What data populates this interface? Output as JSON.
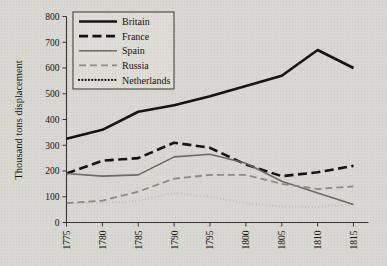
{
  "figure": {
    "background_color": "#d9d7d1",
    "ink_color": "#14110f"
  },
  "axis_titles": {
    "y": "Thousand tons displacement",
    "x": ""
  },
  "legend": {
    "position": "top-left-inside",
    "entries": [
      {
        "label": "Britain",
        "color": "#151210",
        "style": "solid",
        "width": 2.6
      },
      {
        "label": "France",
        "color": "#151210",
        "style": "dashed",
        "width": 2.6
      },
      {
        "label": "Spain",
        "color": "#6d6a64",
        "style": "solid",
        "width": 1.6
      },
      {
        "label": "Russia",
        "color": "#8d8a84",
        "style": "dashed",
        "width": 1.8
      },
      {
        "label": "Netherlands",
        "color": "#151210",
        "style": "dotted",
        "width": 2.2
      }
    ]
  },
  "chart_data": {
    "type": "line",
    "title": "",
    "xlabel": "",
    "ylabel": "Thousand tons displacement",
    "xlim": [
      1775,
      1815
    ],
    "ylim": [
      0,
      800
    ],
    "ytick_values": [
      0,
      100,
      200,
      300,
      400,
      500,
      600,
      700,
      800
    ],
    "ytick_labels": [
      "0",
      "100",
      "200",
      "300",
      "400",
      "500",
      "600",
      "700",
      "800"
    ],
    "xtick_values": [
      1775,
      1780,
      1785,
      1790,
      1795,
      1800,
      1805,
      1810,
      1815
    ],
    "xtick_labels": [
      "1775",
      "1780",
      "1785",
      "1790",
      "1795",
      "1800",
      "1805",
      "1810",
      "1815"
    ],
    "xtick_rotation": 90,
    "grid": false,
    "x": [
      1775,
      1780,
      1785,
      1790,
      1795,
      1800,
      1805,
      1810,
      1815
    ],
    "series": [
      {
        "name": "Britain",
        "color": "#151210",
        "style": "solid",
        "width": 2.6,
        "values": [
          325,
          360,
          430,
          455,
          490,
          530,
          570,
          670,
          600
        ]
      },
      {
        "name": "France",
        "color": "#151210",
        "style": "dashed",
        "width": 2.6,
        "values": [
          190,
          240,
          250,
          310,
          290,
          225,
          180,
          195,
          220
        ]
      },
      {
        "name": "Spain",
        "color": "#6d6a64",
        "style": "solid",
        "width": 1.6,
        "values": [
          190,
          180,
          185,
          255,
          265,
          230,
          160,
          115,
          70
        ]
      },
      {
        "name": "Russia",
        "color": "#8d8a84",
        "style": "dashed",
        "width": 1.8,
        "values": [
          75,
          85,
          120,
          170,
          185,
          185,
          150,
          130,
          140
        ]
      },
      {
        "name": "Netherlands",
        "color": "#151210",
        "style": "dotted",
        "width": 2.2,
        "values": [
          75,
          75,
          85,
          115,
          100,
          75,
          62,
          60,
          72
        ]
      }
    ]
  }
}
